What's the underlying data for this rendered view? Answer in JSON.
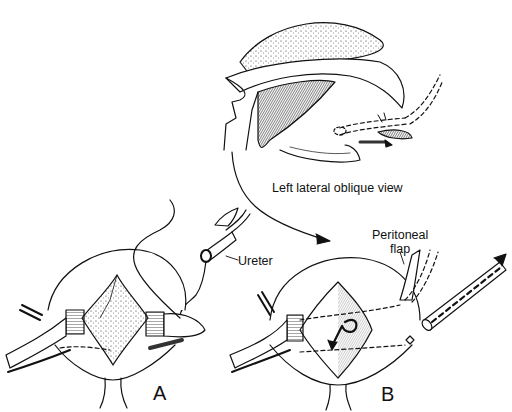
{
  "figure": {
    "type": "surgical line illustration",
    "inset": {
      "caption": "Left lateral oblique view"
    },
    "labels": {
      "ureter": "Ureter",
      "peritoneal_flap_line1": "Peritoneal",
      "peritoneal_flap_line2": "flap"
    },
    "panels": [
      {
        "id": "A",
        "label": "A"
      },
      {
        "id": "B",
        "label": "B"
      }
    ],
    "colors": {
      "ink": "#111111",
      "background": "#ffffff"
    }
  }
}
